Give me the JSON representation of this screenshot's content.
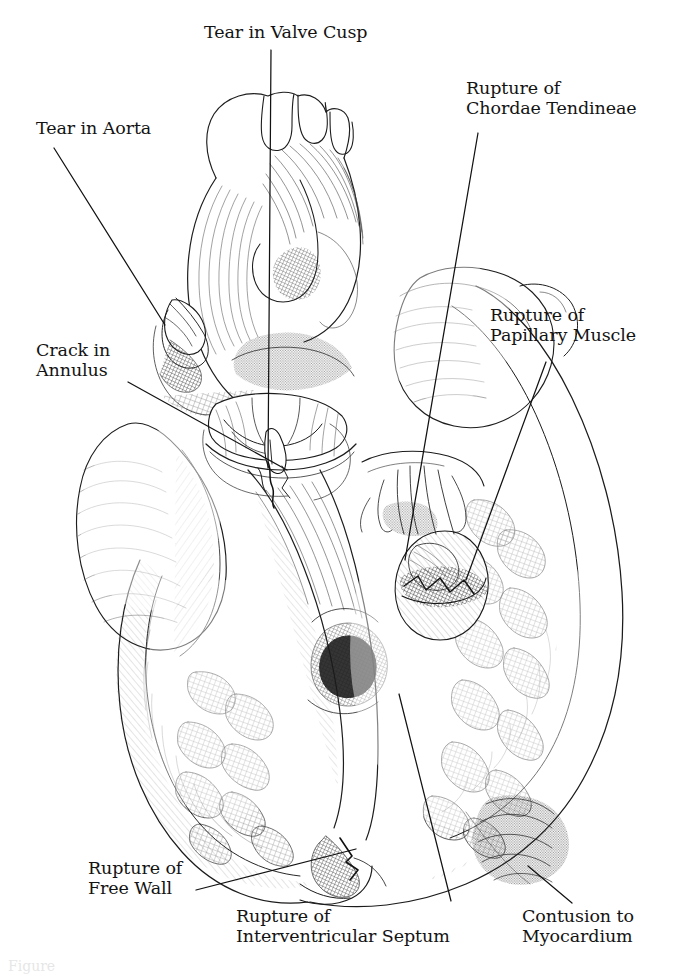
{
  "figure": {
    "domain": "medical-anatomical-illustration",
    "style": "pen-and-ink line drawing with cross-hatching and stipple shading",
    "background_color": "#ffffff",
    "ink_color": "#1a1a1a",
    "caption_fragment": "Figure"
  },
  "labels": [
    {
      "id": "tear-in-aorta",
      "text": "Tear in Aorta",
      "lines": [
        "Tear in Aorta"
      ],
      "x": 36,
      "y": 118,
      "align": "left",
      "leader": {
        "x1": 54,
        "y1": 148,
        "x2": 165,
        "y2": 325
      }
    },
    {
      "id": "tear-in-valve-cusp",
      "text": "Tear in Valve Cusp",
      "lines": [
        "Tear in Valve Cusp"
      ],
      "x": 204,
      "y": 22,
      "align": "left",
      "leader": {
        "x1": 271,
        "y1": 50,
        "x2": 268,
        "y2": 468
      }
    },
    {
      "id": "rupture-of-chordae-tendineae",
      "text": "Rupture of Chordae Tendineae",
      "lines": [
        "Rupture of",
        "Chordae Tendineae"
      ],
      "x": 466,
      "y": 78,
      "align": "left",
      "leader": {
        "x1": 478,
        "y1": 133,
        "x2": 405,
        "y2": 560
      }
    },
    {
      "id": "crack-in-annulus",
      "text": "Crack in Annulus",
      "lines": [
        "Crack in",
        "Annulus"
      ],
      "x": 36,
      "y": 340,
      "align": "left",
      "leader": {
        "x1": 128,
        "y1": 382,
        "x2": 287,
        "y2": 470
      }
    },
    {
      "id": "rupture-of-papillary-muscle",
      "text": "Rupture of Papillary Muscle",
      "lines": [
        "Rupture of",
        "Papillary Muscle"
      ],
      "x": 490,
      "y": 305,
      "align": "left",
      "leader": {
        "x1": 546,
        "y1": 362,
        "x2": 466,
        "y2": 580
      }
    },
    {
      "id": "rupture-of-free-wall",
      "text": "Rupture of Free Wall",
      "lines": [
        "Rupture of",
        "Free Wall"
      ],
      "x": 88,
      "y": 858,
      "align": "left",
      "leader": {
        "x1": 196,
        "y1": 890,
        "x2": 356,
        "y2": 849
      }
    },
    {
      "id": "rupture-of-interventricular-septum",
      "text": "Rupture of Interventricular Septum",
      "lines": [
        "Rupture of",
        "Interventricular Septum"
      ],
      "x": 236,
      "y": 906,
      "align": "left",
      "leader": {
        "x1": 451,
        "y1": 901,
        "x2": 399,
        "y2": 694
      }
    },
    {
      "id": "contusion-to-myocardium",
      "text": "Contusion to Myocardium",
      "lines": [
        "Contusion to",
        "Myocardium"
      ],
      "x": 522,
      "y": 906,
      "align": "left",
      "leader": {
        "x1": 572,
        "y1": 903,
        "x2": 528,
        "y2": 866
      }
    }
  ]
}
